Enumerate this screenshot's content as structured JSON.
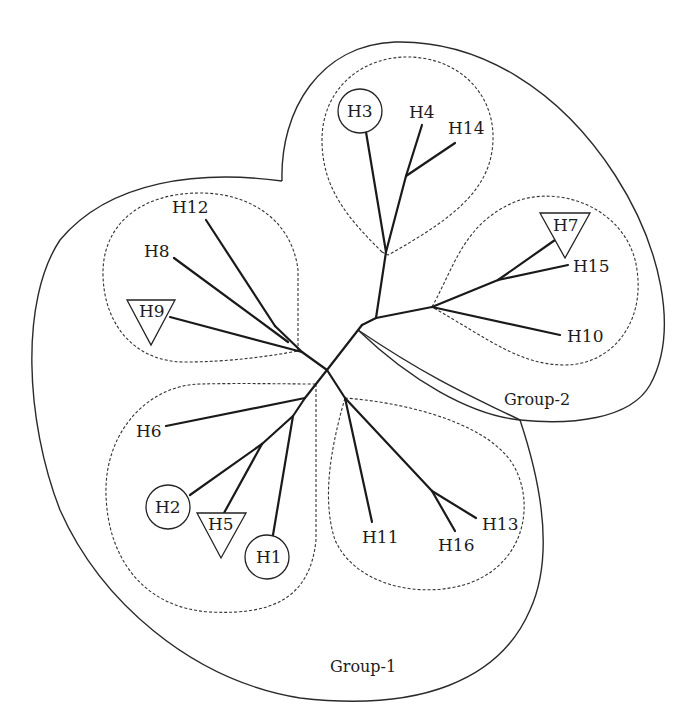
{
  "diagram": {
    "type": "unrooted phylogenetic tree (haplotype network)",
    "groups": [
      {
        "id": "group-1",
        "label": "Group-1"
      },
      {
        "id": "group-2",
        "label": "Group-2"
      }
    ],
    "clusters": [
      {
        "id": "cluster-a",
        "group": "group-2",
        "members": [
          "H3",
          "H4",
          "H14"
        ]
      },
      {
        "id": "cluster-b",
        "group": "group-2",
        "members": [
          "H7",
          "H15",
          "H10"
        ]
      },
      {
        "id": "cluster-c",
        "group": "group-1",
        "members": [
          "H12",
          "H8",
          "H9"
        ]
      },
      {
        "id": "cluster-d",
        "group": "group-1",
        "members": [
          "H6",
          "H2",
          "H5",
          "H1"
        ]
      },
      {
        "id": "cluster-e",
        "group": "group-1",
        "members": [
          "H11",
          "H16",
          "H13"
        ]
      }
    ],
    "nodes": {
      "H1": {
        "label": "H1",
        "marker": "circle"
      },
      "H2": {
        "label": "H2",
        "marker": "circle"
      },
      "H3": {
        "label": "H3",
        "marker": "circle"
      },
      "H4": {
        "label": "H4",
        "marker": "none"
      },
      "H5": {
        "label": "H5",
        "marker": "triangle"
      },
      "H6": {
        "label": "H6",
        "marker": "none"
      },
      "H7": {
        "label": "H7",
        "marker": "triangle"
      },
      "H8": {
        "label": "H8",
        "marker": "none"
      },
      "H9": {
        "label": "H9",
        "marker": "triangle"
      },
      "H10": {
        "label": "H10",
        "marker": "none"
      },
      "H11": {
        "label": "H11",
        "marker": "none"
      },
      "H12": {
        "label": "H12",
        "marker": "none"
      },
      "H13": {
        "label": "H13",
        "marker": "none"
      },
      "H14": {
        "label": "H14",
        "marker": "none"
      },
      "H15": {
        "label": "H15",
        "marker": "none"
      },
      "H16": {
        "label": "H16",
        "marker": "none"
      }
    },
    "legend_markers": {
      "circle": "circle-marked haplotypes",
      "triangle": "inverted-triangle-marked haplotypes"
    }
  }
}
